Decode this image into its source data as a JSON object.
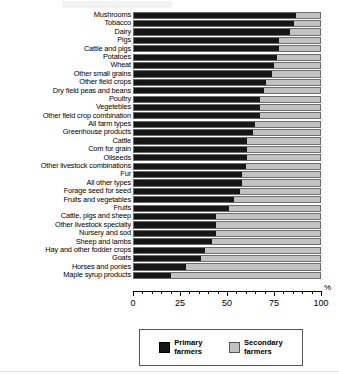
{
  "chart_data": {
    "type": "bar",
    "orientation": "horizontal",
    "stacked": true,
    "title": "",
    "xlabel": "%",
    "ylabel": "",
    "xlim": [
      0,
      100
    ],
    "xticks": [
      0,
      25,
      50,
      75,
      100
    ],
    "xtick_labels": [
      "0",
      "25",
      "50",
      "75",
      "100"
    ],
    "grid": false,
    "legend_position": "bottom",
    "axis_unit": "%",
    "categories": [
      "Mushrooms",
      "Tobacco",
      "Dairy",
      "Pigs",
      "Cattle and pigs",
      "Potatoes",
      "Wheat",
      "Other small grains",
      "Other field crops",
      "Dry field peas and beans",
      "Poultry",
      "Vegetebles",
      "Other field crop combination",
      "All farm types",
      "Greenhouse products",
      "Cattle",
      "Com for grain",
      "Oilseeds",
      "Other livestock combinations",
      "Fur",
      "All other types",
      "Forage seed for seed",
      "Fruits and vegetables",
      "Fruits",
      "Cattle, pigs and sheep",
      "Other livestock specialty",
      "Nursery and sod",
      "Sheep and lambs",
      "Hay and other fodder crops",
      "Goats",
      "Horses and ponies",
      "Maple syrup products"
    ],
    "series": [
      {
        "name": "Primary farmers",
        "color": "#161616",
        "values": [
          87,
          86,
          84,
          78,
          78,
          77,
          75,
          74,
          71,
          70,
          68,
          68,
          68,
          65,
          64,
          61,
          61,
          61,
          60,
          58,
          58,
          57,
          54,
          51,
          44,
          44,
          44,
          42,
          38,
          36,
          28,
          20
        ]
      },
      {
        "name": "Secondary farmers",
        "color": "#c2c2c2",
        "values": [
          13,
          14,
          16,
          22,
          22,
          23,
          25,
          26,
          29,
          30,
          32,
          32,
          32,
          35,
          36,
          39,
          39,
          39,
          40,
          42,
          42,
          43,
          46,
          49,
          56,
          56,
          56,
          58,
          62,
          64,
          72,
          80
        ]
      }
    ]
  },
  "legend": {
    "items": [
      {
        "label_line1": "Primary",
        "label_line2": "farmers",
        "swatch": "primary-swatch"
      },
      {
        "label_line1": "Secondary",
        "label_line2": "farmers",
        "swatch": "secondary-swatch"
      }
    ]
  }
}
